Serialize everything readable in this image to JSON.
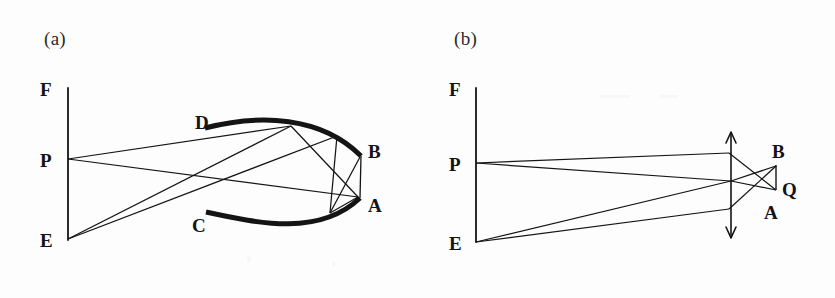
{
  "figure": {
    "background_color": "#fdfdfd",
    "ink_color": "#141414",
    "width": 835,
    "height": 298
  },
  "panels": [
    {
      "id": "a",
      "caption": "(a)",
      "caption_pos": {
        "x": 44,
        "y": 28
      },
      "description": "Object plane F-P-E on the left; a pair of thick curved reflecting arcs (D-B upper, C-A lower) on the right; rays from P and E reflect between the arcs and converge at A and B.",
      "axis": {
        "name": "object-plane",
        "x": 68,
        "y_top": 88,
        "y_bottom": 240
      },
      "points": [
        {
          "label": "F",
          "x": 68,
          "y": 88,
          "label_x": 40,
          "label_y": 80
        },
        {
          "label": "P",
          "x": 68,
          "y": 159,
          "label_x": 40,
          "label_y": 151
        },
        {
          "label": "E",
          "x": 68,
          "y": 239,
          "label_x": 40,
          "label_y": 231
        },
        {
          "label": "D",
          "x": 205,
          "y": 128,
          "label_x": 195,
          "label_y": 113
        },
        {
          "label": "C",
          "x": 206,
          "y": 212,
          "label_x": 192,
          "label_y": 216
        },
        {
          "label": "B",
          "x": 361,
          "y": 156,
          "label_x": 368,
          "label_y": 142
        },
        {
          "label": "A",
          "x": 360,
          "y": 198,
          "label_x": 368,
          "label_y": 196
        }
      ],
      "arcs": [
        {
          "name": "upper-mirror-arc-DB",
          "from": "D",
          "to": "B",
          "stroke_width": 5
        },
        {
          "name": "lower-mirror-arc-CA",
          "from": "C",
          "to": "A",
          "stroke_width": 5
        }
      ],
      "rays": [
        {
          "name": "ray-P-to-upper-arc",
          "from": "P",
          "to_x": 291,
          "to_y": 126
        },
        {
          "name": "ray-P-to-A",
          "from": "P",
          "to_x": 358,
          "to_y": 197
        },
        {
          "name": "ray-E-to-upper-arc",
          "from": "E",
          "to_x": 291,
          "to_y": 126
        },
        {
          "name": "ray-E-to-upper-right",
          "from": "E",
          "to_x": 337,
          "to_y": 136
        },
        {
          "name": "ray-upperarc-to-A",
          "from_x": 291,
          "from_y": 126,
          "to_x": 358,
          "to_y": 197
        },
        {
          "name": "ray-upperright-to-lowerarc",
          "from_x": 337,
          "from_y": 136,
          "to_x": 330,
          "to_y": 213
        },
        {
          "name": "ray-lowerarc-to-B",
          "from_x": 330,
          "from_y": 213,
          "to_x": 360,
          "to_y": 157
        },
        {
          "name": "ray-A-to-lowerarc",
          "from_x": 358,
          "from_y": 197,
          "to_x": 330,
          "to_y": 213
        },
        {
          "name": "chord-B-to-A",
          "from": "B",
          "to": "A"
        }
      ]
    },
    {
      "id": "b",
      "caption": "(b)",
      "caption_pos": {
        "x": 454,
        "y": 28
      },
      "description": "Object plane F-P-E on the left; a thin lens drawn as a vertical double-headed arrow; rays from P and E cross behind the lens forming image points B, Q and A.",
      "axis": {
        "name": "object-plane",
        "x": 476,
        "y_top": 88,
        "y_bottom": 242
      },
      "lens": {
        "name": "thin-lens-arrow",
        "x": 731,
        "y_top": 132,
        "y_bottom": 238,
        "arrowheads": "both"
      },
      "points": [
        {
          "label": "F",
          "x": 476,
          "y": 88,
          "label_x": 449,
          "label_y": 80
        },
        {
          "label": "P",
          "x": 476,
          "y": 163,
          "label_x": 449,
          "label_y": 155
        },
        {
          "label": "E",
          "x": 476,
          "y": 242,
          "label_x": 449,
          "label_y": 234
        },
        {
          "label": "B",
          "x": 776,
          "y": 165,
          "label_x": 772,
          "label_y": 142
        },
        {
          "label": "Q",
          "x": 776,
          "y": 190,
          "label_x": 782,
          "label_y": 180
        },
        {
          "label": "A",
          "x": 767,
          "y": 213,
          "label_x": 764,
          "label_y": 203
        }
      ],
      "rays": [
        {
          "name": "ray-P-to-lens-top",
          "from": "P",
          "to_x": 729,
          "to_y": 153
        },
        {
          "name": "ray-P-to-lens-mid",
          "from": "P",
          "to_x": 731,
          "to_y": 181
        },
        {
          "name": "ray-E-to-lens-mid",
          "from": "E",
          "to_x": 731,
          "to_y": 181
        },
        {
          "name": "ray-E-to-lens-bottom",
          "from": "E",
          "to_x": 729,
          "to_y": 209
        },
        {
          "name": "ray-lenstop-to-Q",
          "from_x": 729,
          "from_y": 153,
          "to_x": 776,
          "to_y": 190
        },
        {
          "name": "ray-lensmid-to-B",
          "from_x": 731,
          "from_y": 181,
          "to_x": 776,
          "to_y": 166
        },
        {
          "name": "ray-lensbottom-to-B",
          "from_x": 729,
          "from_y": 209,
          "to_x": 776,
          "to_y": 166
        },
        {
          "name": "ray-lensmid-to-Q",
          "from_x": 731,
          "from_y": 181,
          "to_x": 776,
          "to_y": 190
        },
        {
          "name": "chord-B-to-Q",
          "from": "B",
          "to": "Q"
        }
      ]
    }
  ]
}
